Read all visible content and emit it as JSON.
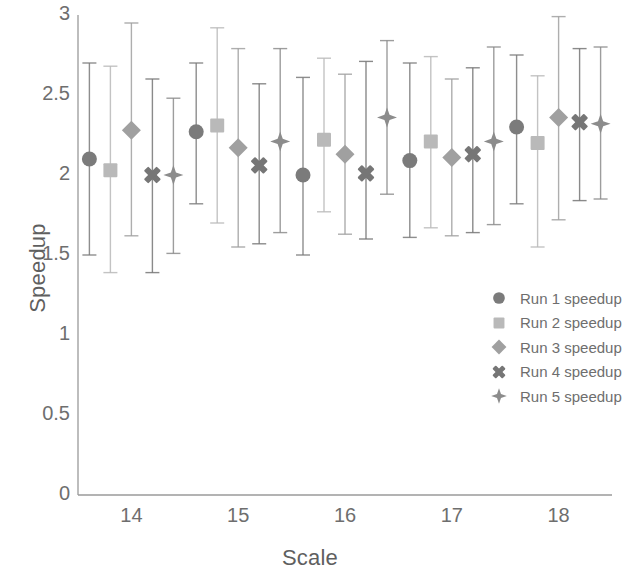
{
  "chart_data": {
    "type": "scatter",
    "title": "",
    "xlabel": "Scale",
    "ylabel": "Speedup",
    "categories": [
      "14",
      "15",
      "16",
      "17",
      "18"
    ],
    "xtick_labels": [
      "14",
      "15",
      "16",
      "17",
      "18"
    ],
    "ytick_labels": [
      "0",
      "0.5",
      "1",
      "1.5",
      "2",
      "2.5",
      "3"
    ],
    "ytick_values": [
      0,
      0.5,
      1,
      1.5,
      2,
      2.5,
      3
    ],
    "ylim": [
      0,
      3
    ],
    "grid": false,
    "legend_position": "lower-right",
    "error_bars": true,
    "series": [
      {
        "name": "Run 1 speedup",
        "marker": "circle",
        "color": "#7b7b7b",
        "values": [
          2.1,
          2.27,
          2.0,
          2.09,
          2.3
        ],
        "err_low": [
          1.5,
          1.82,
          1.5,
          1.61,
          1.82
        ],
        "err_high": [
          2.7,
          2.7,
          2.61,
          2.7,
          2.75
        ]
      },
      {
        "name": "Run 2 speedup",
        "marker": "square",
        "color": "#b9b9b9",
        "values": [
          2.03,
          2.31,
          2.22,
          2.21,
          2.2
        ],
        "err_low": [
          1.39,
          1.7,
          1.77,
          1.67,
          1.55
        ],
        "err_high": [
          2.68,
          2.92,
          2.73,
          2.74,
          2.62
        ]
      },
      {
        "name": "Run 3 speedup",
        "marker": "diamond",
        "color": "#a0a0a0",
        "values": [
          2.28,
          2.17,
          2.13,
          2.11,
          2.36
        ],
        "err_low": [
          1.62,
          1.55,
          1.63,
          1.62,
          1.72
        ],
        "err_high": [
          2.95,
          2.79,
          2.63,
          2.6,
          2.99
        ]
      },
      {
        "name": "Run 4 speedup",
        "marker": "cross",
        "color": "#767676",
        "values": [
          2.0,
          2.06,
          2.01,
          2.13,
          2.33
        ],
        "err_low": [
          1.39,
          1.57,
          1.6,
          1.64,
          1.84
        ],
        "err_high": [
          2.6,
          2.57,
          2.71,
          2.67,
          2.79
        ]
      },
      {
        "name": "Run 5 speedup",
        "marker": "star",
        "color": "#8c8c8c",
        "values": [
          2.0,
          2.21,
          2.36,
          2.21,
          2.32
        ],
        "err_low": [
          1.51,
          1.64,
          1.88,
          1.69,
          1.85
        ],
        "err_high": [
          2.48,
          2.79,
          2.84,
          2.8,
          2.8
        ]
      }
    ]
  },
  "axes": {
    "ylabel": "Speedup",
    "xlabel": "Scale"
  },
  "legend": {
    "items": [
      {
        "label": "Run 1 speedup"
      },
      {
        "label": "Run 2 speedup"
      },
      {
        "label": "Run 3 speedup"
      },
      {
        "label": "Run 4 speedup"
      },
      {
        "label": "Run 5 speedup"
      }
    ]
  },
  "style": {
    "axis_color": "#9a9a9a",
    "text_color": "#6e6e6e",
    "background": "#ffffff",
    "errorbar_color": "#9c9c9c"
  }
}
